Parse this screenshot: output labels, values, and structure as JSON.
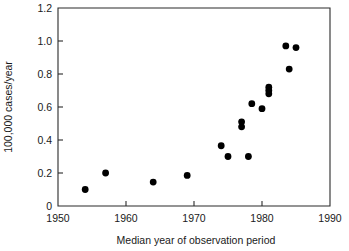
{
  "chart_data": {
    "type": "scatter",
    "title": "",
    "xlabel": "Median year of observation period",
    "ylabel": "100,000 cases/year",
    "xlim": [
      1950,
      1990
    ],
    "ylim": [
      0,
      1.2
    ],
    "grid": false,
    "legend": null,
    "xticks": [
      1950,
      1960,
      1970,
      1980,
      1990
    ],
    "xtick_labels": [
      "1950",
      "1960",
      "1970",
      "1980",
      "1990"
    ],
    "yticks": [
      0,
      0.2,
      0.4,
      0.6,
      0.8,
      1.0,
      1.2
    ],
    "ytick_labels": [
      "0",
      "0.2",
      "0.4",
      "0.6",
      "0.8",
      "1.0",
      "1.2"
    ],
    "marker": "filled-circle",
    "marker_color": "#000000",
    "points": [
      {
        "x": 1954.0,
        "y": 0.1
      },
      {
        "x": 1957.0,
        "y": 0.2
      },
      {
        "x": 1964.0,
        "y": 0.145
      },
      {
        "x": 1969.0,
        "y": 0.185
      },
      {
        "x": 1974.0,
        "y": 0.365
      },
      {
        "x": 1975.0,
        "y": 0.3
      },
      {
        "x": 1977.0,
        "y": 0.51
      },
      {
        "x": 1977.0,
        "y": 0.48
      },
      {
        "x": 1978.0,
        "y": 0.3
      },
      {
        "x": 1978.5,
        "y": 0.62
      },
      {
        "x": 1980.0,
        "y": 0.59
      },
      {
        "x": 1981.0,
        "y": 0.72
      },
      {
        "x": 1981.0,
        "y": 0.7
      },
      {
        "x": 1981.0,
        "y": 0.68
      },
      {
        "x": 1983.5,
        "y": 0.97
      },
      {
        "x": 1984.0,
        "y": 0.83
      },
      {
        "x": 1985.0,
        "y": 0.96
      }
    ]
  },
  "figure": {
    "background_color": "#ffffff",
    "axis_color": "#2b2b2b"
  }
}
